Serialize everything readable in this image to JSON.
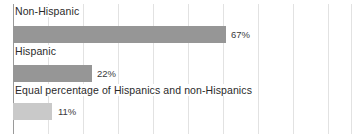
{
  "chart_data": {
    "type": "bar",
    "orientation": "horizontal",
    "title": "",
    "subtitle": "",
    "xlabel": "",
    "ylabel": "",
    "categories": [
      "Non-Hispanic",
      "Hispanic",
      "Equal percentage of Hispanics and non-Hispanics"
    ],
    "values": [
      67,
      22,
      11
    ],
    "value_labels": [
      "67%",
      "22%",
      "11%"
    ],
    "unit": "%",
    "xlim": [
      0,
      107
    ],
    "grid": true,
    "grid_axis": "x",
    "legend": false,
    "legend_position": "none",
    "series": [
      {
        "name": "Percent of respondents",
        "values": [
          67,
          22,
          11
        ]
      }
    ],
    "bar_colors": [
      "#969696",
      "#969696",
      "#c9c9c9"
    ],
    "background_color": "#ffffff",
    "gridline_color": "#e2e2e2",
    "axis_color": "#9a9a9a",
    "label_color": "#2a2a2a"
  },
  "bars": [
    {
      "category": "Non-Hispanic",
      "value_label": "67%",
      "label_top": "5px",
      "bar_top": "26px",
      "bar_left": "13px",
      "bar_width": "213px",
      "value_left": "230px",
      "value_top": "29px",
      "color_class": "bar-dark"
    },
    {
      "category": "Hispanic",
      "value_label": "22%",
      "label_top": "45px",
      "bar_top": "65px",
      "bar_left": "13px",
      "bar_width": "79px",
      "value_left": "96px",
      "value_top": "68px",
      "color_class": "bar-light-mid"
    },
    {
      "category": "Equal percentage of Hispanics and non-Hispanics",
      "value_label": "11%",
      "label_top": "84px",
      "bar_top": "103px",
      "bar_left": "13px",
      "bar_width": "39px",
      "value_left": "57px",
      "value_top": "106px",
      "color_class": "bar-light"
    }
  ],
  "gridlines": [
    {
      "x": "13px",
      "axis": true
    },
    {
      "x": "48px",
      "axis": false
    },
    {
      "x": "83px",
      "axis": false
    },
    {
      "x": "118px",
      "axis": false
    },
    {
      "x": "153px",
      "axis": false
    },
    {
      "x": "188px",
      "axis": false
    },
    {
      "x": "223px",
      "axis": false
    },
    {
      "x": "258px",
      "axis": false
    },
    {
      "x": "293px",
      "axis": false
    },
    {
      "x": "328px",
      "axis": false
    },
    {
      "x": "351px",
      "axis": false
    }
  ]
}
